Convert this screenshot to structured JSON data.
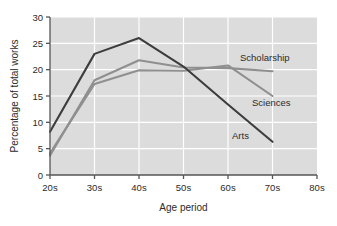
{
  "chart_data": {
    "type": "line",
    "title": "",
    "xlabel": "Age period",
    "ylabel": "Percentage of total works",
    "categories": [
      "20s",
      "30s",
      "40s",
      "50s",
      "60s",
      "70s",
      "80s"
    ],
    "x_ticks": [
      "20s",
      "30s",
      "40s",
      "50s",
      "60s",
      "70s",
      "80s"
    ],
    "y_ticks": [
      "0",
      "5",
      "10",
      "15",
      "20",
      "25",
      "30"
    ],
    "ylim": [
      0,
      30
    ],
    "grid": "horizontal-and-vertical-white",
    "legend": "inline-labels-at-line-ends",
    "series": [
      {
        "name": "Arts",
        "color": "#3d3d3d",
        "x": [
          "20s",
          "30s",
          "40s",
          "50s",
          "60s",
          "70s"
        ],
        "values": [
          8.2,
          23.0,
          26.0,
          20.6,
          13.4,
          6.3
        ]
      },
      {
        "name": "Scholarship",
        "color": "#8f8f8f",
        "x": [
          "20s",
          "30s",
          "40s",
          "50s",
          "60s",
          "70s"
        ],
        "values": [
          3.7,
          18.0,
          21.8,
          20.4,
          20.3,
          19.7
        ]
      },
      {
        "name": "Sciences",
        "color": "#8f8f8f",
        "x": [
          "20s",
          "30s",
          "40s",
          "50s",
          "60s",
          "70s"
        ],
        "values": [
          4.1,
          17.3,
          19.9,
          19.8,
          20.8,
          15.0
        ]
      }
    ],
    "annotations": [
      {
        "text": "Scholarship",
        "x": "between-60s-and-70s",
        "y": 22.6
      },
      {
        "text": "Sciences",
        "x": "near-70s",
        "y": 16.9
      },
      {
        "text": "Arts",
        "x": "near-70s",
        "y": 10.2
      }
    ],
    "colors": {
      "plot_background": "#dcdcdc",
      "gridline": "#ffffff",
      "axis": "#555555",
      "text": "#2b2b2b",
      "arts_line": "#3d3d3d",
      "scholarship_line": "#8f8f8f",
      "sciences_line": "#8f8f8f"
    }
  }
}
